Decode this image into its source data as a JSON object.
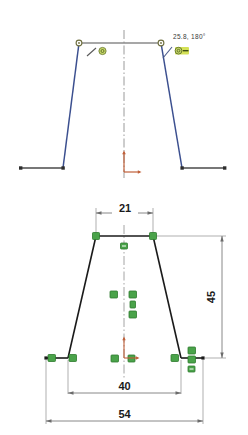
{
  "app": {
    "kind": "cad-sketch-viewport",
    "background_color": "#ffffff"
  },
  "colors": {
    "sketch_underdefined": "#3b4f8f",
    "sketch_defined": "#1a1a1a",
    "construction_line": "#8a8a8a",
    "centerline": "#8f8f8f",
    "dimension": "#6b6b6b",
    "relation_green": "#3f9b3f",
    "relation_green_light": "#55b355",
    "highlight_yellow": "#d4e157",
    "origin_red": "#c0603a",
    "endpoint_ring": "#7a7a4a"
  },
  "views": [
    {
      "name": "upper-view",
      "state": "under-defined",
      "line_color": "#3b4f8f",
      "description": "Trapezoid sketch in progress, blue under-defined geometry",
      "tooltip": {
        "value": "25.8, 180°",
        "visible": true
      },
      "icons": [
        {
          "name": "line-tool-icon",
          "label": "line"
        },
        {
          "name": "coincident-relation-icon",
          "label": "coincident"
        },
        {
          "name": "horizontal-relation-icon",
          "label": "horizontal",
          "highlighted": true
        }
      ],
      "origin": {
        "name": "origin-marker",
        "label": "origin"
      },
      "centerline": {
        "name": "vertical-centerline",
        "label": "centerline"
      }
    },
    {
      "name": "lower-view",
      "state": "fully-defined",
      "line_color": "#1a1a1a",
      "description": "Trapezoid sketch fully defined with dimensions and relations",
      "origin": {
        "name": "origin-marker",
        "label": "origin"
      },
      "centerline": {
        "name": "vertical-centerline",
        "label": "centerline"
      }
    }
  ],
  "dimensions": [
    {
      "id": "top-width",
      "value": "21",
      "orientation": "horizontal",
      "position": "top"
    },
    {
      "id": "height",
      "value": "45",
      "orientation": "vertical",
      "position": "right"
    },
    {
      "id": "middle-width",
      "value": "40",
      "orientation": "horizontal",
      "position": "middle"
    },
    {
      "id": "overall-width",
      "value": "54",
      "orientation": "horizontal",
      "position": "bottom"
    }
  ],
  "relations": [
    {
      "id": "r1",
      "type": "coincident",
      "view": "lower-view",
      "anchor": "top-left-vertex"
    },
    {
      "id": "r2",
      "type": "coincident",
      "view": "lower-view",
      "anchor": "top-right-vertex"
    },
    {
      "id": "r3",
      "type": "horizontal",
      "view": "lower-view",
      "anchor": "top-edge"
    },
    {
      "id": "r4",
      "type": "symmetric",
      "view": "lower-view",
      "anchor": "center-left"
    },
    {
      "id": "r5",
      "type": "symmetric",
      "view": "lower-view",
      "anchor": "center-right"
    },
    {
      "id": "r6",
      "type": "vertical",
      "view": "lower-view",
      "anchor": "centerline"
    },
    {
      "id": "r7",
      "type": "coincident",
      "view": "lower-view",
      "anchor": "center-lower"
    },
    {
      "id": "r8",
      "type": "coincident",
      "view": "lower-view",
      "anchor": "bottom-left-end"
    },
    {
      "id": "r9",
      "type": "coincident",
      "view": "lower-view",
      "anchor": "bottom-left-vertex"
    },
    {
      "id": "r10",
      "type": "coincident",
      "view": "lower-view",
      "anchor": "bottom-center-left"
    },
    {
      "id": "r11",
      "type": "coincident",
      "view": "lower-view",
      "anchor": "bottom-center-right"
    },
    {
      "id": "r12",
      "type": "coincident",
      "view": "lower-view",
      "anchor": "bottom-right-vertex"
    },
    {
      "id": "r13",
      "type": "coincident",
      "view": "lower-view",
      "anchor": "bottom-right-upper"
    },
    {
      "id": "r14",
      "type": "horizontal",
      "view": "lower-view",
      "anchor": "bottom-right-edge"
    }
  ]
}
